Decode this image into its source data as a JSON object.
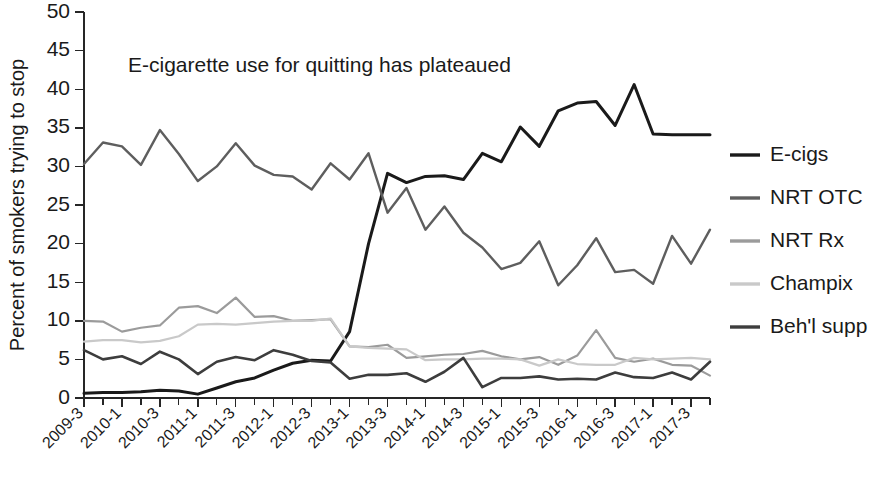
{
  "chart_data": {
    "type": "line",
    "title": "",
    "annotation": "E-cigarette use for quitting has plateaued",
    "xlabel": "",
    "ylabel": "Percent of smokers trying to stop",
    "ylim": [
      0,
      50
    ],
    "yticks": [
      0,
      5,
      10,
      15,
      20,
      25,
      30,
      35,
      40,
      45,
      50
    ],
    "grid": false,
    "legend_position": "right",
    "x": [
      "2009-3",
      "2009-4",
      "2010-1",
      "2010-2",
      "2010-3",
      "2010-4",
      "2011-1",
      "2011-2",
      "2011-3",
      "2011-4",
      "2012-1",
      "2012-2",
      "2012-3",
      "2012-4",
      "2013-1",
      "2013-2",
      "2013-3",
      "2013-4",
      "2014-1",
      "2014-2",
      "2014-3",
      "2014-4",
      "2015-1",
      "2015-2",
      "2015-3",
      "2015-4",
      "2016-1",
      "2016-2",
      "2016-3",
      "2016-4",
      "2017-1",
      "2017-2",
      "2017-3",
      "2017-4"
    ],
    "xtick_labels": [
      "2009-3",
      "2010-1",
      "2010-3",
      "2011-1",
      "2011-3",
      "2012-1",
      "2012-3",
      "2013-1",
      "2013-3",
      "2014-1",
      "2014-3",
      "2015-1",
      "2015-3",
      "2016-1",
      "2016-3",
      "2017-1",
      "2017-3"
    ],
    "xtick_indices": [
      0,
      2,
      4,
      6,
      8,
      10,
      12,
      14,
      16,
      18,
      20,
      22,
      24,
      26,
      28,
      30,
      32
    ],
    "series": [
      {
        "name": "E-cigs",
        "color": "#1a1a1a",
        "width": 3.0,
        "values": [
          0.6,
          0.7,
          0.7,
          0.8,
          1.0,
          0.9,
          0.5,
          1.3,
          2.1,
          2.6,
          3.6,
          4.5,
          4.9,
          4.8,
          8.6,
          20.0,
          29.1,
          27.9,
          28.7,
          28.8,
          28.3,
          31.7,
          30.6,
          35.1,
          32.6,
          37.2,
          38.2,
          38.4,
          35.3,
          40.6,
          34.2,
          34.1,
          34.1,
          34.1
        ]
      },
      {
        "name": "NRT OTC",
        "color": "#5e5e5e",
        "width": 2.4,
        "values": [
          30.3,
          33.1,
          32.6,
          30.2,
          34.7,
          31.6,
          28.1,
          30.0,
          33.0,
          30.1,
          28.9,
          28.7,
          27.0,
          30.4,
          28.3,
          31.7,
          24.0,
          27.2,
          21.8,
          24.8,
          21.4,
          19.5,
          16.7,
          17.5,
          20.3,
          14.6,
          17.2,
          20.7,
          16.3,
          16.6,
          14.8,
          21.0,
          17.4,
          21.8
        ]
      },
      {
        "name": "NRT Rx",
        "color": "#9b9b9b",
        "width": 2.2,
        "values": [
          10.0,
          9.9,
          8.6,
          9.1,
          9.4,
          11.7,
          11.9,
          11.0,
          13.0,
          10.5,
          10.6,
          10.0,
          10.1,
          10.2,
          6.7,
          6.6,
          6.9,
          5.2,
          5.4,
          5.6,
          5.7,
          6.1,
          5.4,
          5.0,
          5.3,
          4.3,
          5.5,
          8.8,
          5.2,
          4.7,
          5.1,
          4.3,
          4.2,
          2.9
        ]
      },
      {
        "name": "Champix",
        "color": "#c9c9c9",
        "width": 2.2,
        "values": [
          7.3,
          7.5,
          7.5,
          7.2,
          7.4,
          8.0,
          9.5,
          9.6,
          9.5,
          9.7,
          9.9,
          10.0,
          10.0,
          10.3,
          6.7,
          6.5,
          6.4,
          6.3,
          4.9,
          5.0,
          5.0,
          5.1,
          5.1,
          5.0,
          4.2,
          5.0,
          4.4,
          4.3,
          4.3,
          5.2,
          5.0,
          5.1,
          5.2,
          5.0
        ]
      },
      {
        "name": "Beh'l supp",
        "color": "#3d3d3d",
        "width": 2.6,
        "values": [
          6.2,
          5.0,
          5.4,
          4.4,
          6.0,
          5.0,
          3.1,
          4.7,
          5.3,
          4.9,
          6.2,
          5.6,
          4.8,
          4.6,
          2.5,
          3.0,
          3.0,
          3.2,
          2.1,
          3.4,
          5.2,
          1.4,
          2.6,
          2.6,
          2.8,
          2.4,
          2.5,
          2.4,
          3.3,
          2.7,
          2.6,
          3.3,
          2.4,
          4.7
        ]
      }
    ]
  },
  "legend": {
    "items": [
      {
        "label": "E-cigs",
        "color": "#1a1a1a"
      },
      {
        "label": "NRT OTC",
        "color": "#5e5e5e"
      },
      {
        "label": "NRT Rx",
        "color": "#9b9b9b"
      },
      {
        "label": "Champix",
        "color": "#c9c9c9"
      },
      {
        "label": "Beh'l supp",
        "color": "#3d3d3d"
      }
    ]
  }
}
